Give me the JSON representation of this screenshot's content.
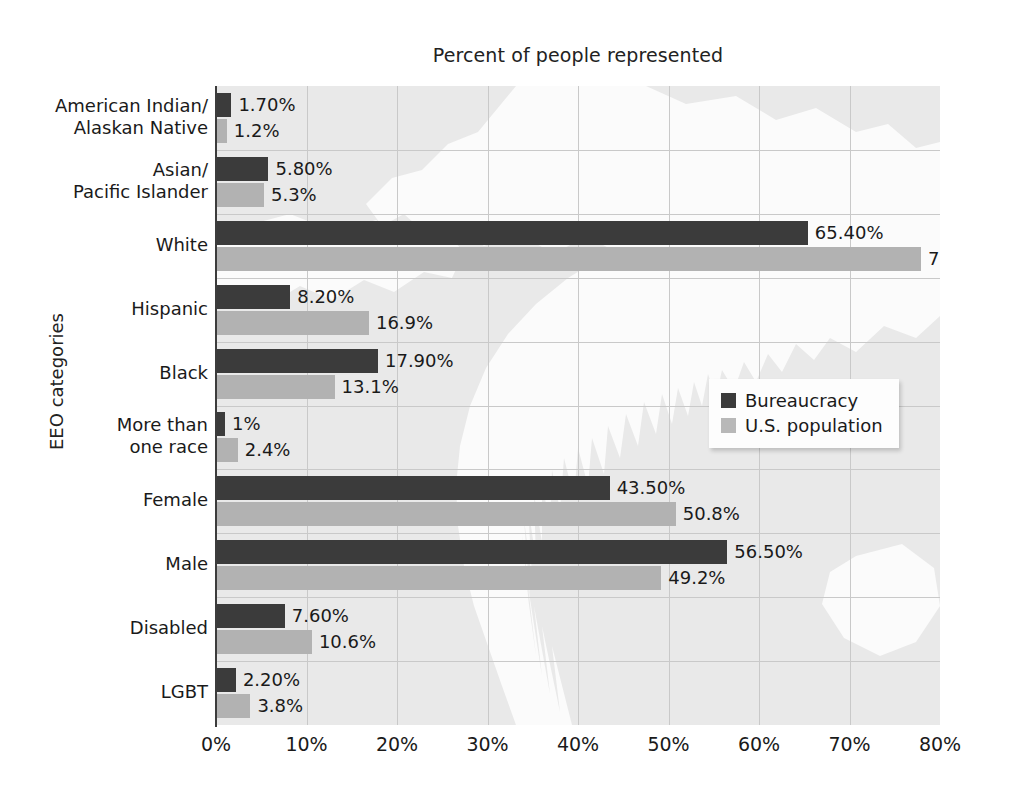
{
  "chart_data": {
    "type": "bar",
    "orientation": "horizontal",
    "title": "Percent of people represented",
    "xlabel": "",
    "ylabel": "EEO categories",
    "xlim": [
      0,
      80
    ],
    "xticks": [
      "0%",
      "10%",
      "20%",
      "30%",
      "40%",
      "50%",
      "60%",
      "70%",
      "80%"
    ],
    "xtick_values": [
      0,
      10,
      20,
      30,
      40,
      50,
      60,
      70,
      80
    ],
    "grid": true,
    "legend_position": "center-right",
    "categories": [
      "American Indian/\nAlaskan Native",
      "Asian/\nPacific Islander",
      "White",
      "Hispanic",
      "Black",
      "More than\none race",
      "Female",
      "Male",
      "Disabled",
      "LGBT"
    ],
    "category_lines": [
      [
        "American Indian/",
        "Alaskan Native"
      ],
      [
        "Asian/",
        "Pacific Islander"
      ],
      [
        "White"
      ],
      [
        "Hispanic"
      ],
      [
        "Black"
      ],
      [
        "More than",
        "one race"
      ],
      [
        "Female"
      ],
      [
        "Male"
      ],
      [
        "Disabled"
      ],
      [
        "LGBT"
      ]
    ],
    "series": [
      {
        "name": "Bureaucracy",
        "color": "#3b3b3b",
        "values": [
          1.7,
          5.8,
          65.4,
          8.2,
          17.9,
          1.0,
          43.5,
          56.5,
          7.6,
          2.2
        ],
        "labels": [
          "1.70%",
          "5.80%",
          "65.40%",
          "8.20%",
          "17.90%",
          "1%",
          "43.50%",
          "56.50%",
          "7.60%",
          "2.20%"
        ]
      },
      {
        "name": "U.S. population",
        "color": "#b2b2b2",
        "values": [
          1.2,
          5.3,
          77.9,
          16.9,
          13.1,
          2.4,
          50.8,
          49.2,
          10.6,
          3.8
        ],
        "labels": [
          "1.2%",
          "5.3%",
          "77.9%",
          "16.9%",
          "13.1%",
          "2.4%",
          "50.8%",
          "49.2%",
          "10.6%",
          "3.8%"
        ]
      }
    ]
  },
  "legend": {
    "items": [
      {
        "label": "Bureaucracy",
        "color": "#3b3b3b"
      },
      {
        "label": "U.S. population",
        "color": "#b8b8b8"
      }
    ]
  },
  "colors": {
    "plot_background": "#e9e9e9",
    "page_background": "#ffffff",
    "gridline": "#c9c9c9",
    "axis": "#3c3c3c",
    "text": "#1a1a1a"
  }
}
